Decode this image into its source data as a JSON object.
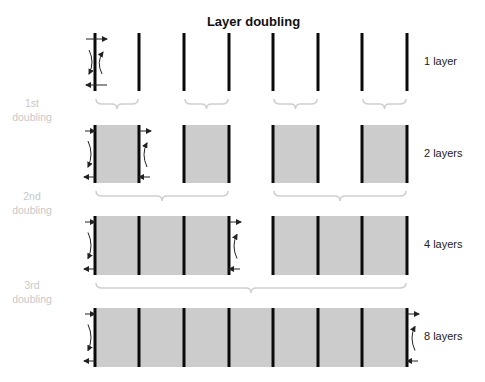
{
  "title": "Layer doubling",
  "colors": {
    "bar": "#0a0a0a",
    "fill": "#cccccc",
    "bracket": "#cfcfcf",
    "doubling_text": "#c8c8c8",
    "arrow": "#222222"
  },
  "rows": [
    {
      "label": "1 layer",
      "layers": 1,
      "y_top": 33,
      "y_bottom": 91,
      "blocks": []
    },
    {
      "label": "2 layers",
      "layers": 2,
      "y_top": 125,
      "y_bottom": 183,
      "blocks": [
        [
          0,
          1
        ],
        [
          2,
          3
        ],
        [
          4,
          5
        ],
        [
          6,
          7
        ]
      ]
    },
    {
      "label": "4 layers",
      "layers": 4,
      "y_top": 216,
      "y_bottom": 275,
      "blocks": [
        [
          0,
          3
        ],
        [
          4,
          7
        ]
      ]
    },
    {
      "label": "8 layers",
      "layers": 8,
      "y_top": 308,
      "y_bottom": 367,
      "blocks": [
        [
          0,
          7
        ]
      ]
    }
  ],
  "bar_x": [
    95,
    139,
    184,
    229,
    273,
    318,
    362,
    407
  ],
  "doublings": [
    {
      "line1": "1st",
      "line2": "doubling",
      "y": 95,
      "brackets": [
        [
          95,
          139
        ],
        [
          184,
          229
        ],
        [
          273,
          318
        ],
        [
          362,
          407
        ]
      ],
      "bracket_y": 99
    },
    {
      "line1": "2nd",
      "line2": "doubling",
      "y": 189,
      "brackets": [
        [
          95,
          229
        ],
        [
          273,
          407
        ]
      ],
      "bracket_y": 191
    },
    {
      "line1": "3rd",
      "line2": "doubling",
      "y": 279,
      "brackets": [
        [
          95,
          407
        ]
      ],
      "bracket_y": 283
    }
  ]
}
